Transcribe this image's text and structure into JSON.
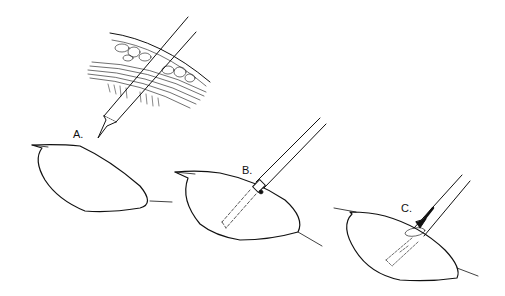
{
  "figure": {
    "type": "surgical-technique-illustration",
    "ink_color": "#111111",
    "background": "#ffffff",
    "inset": {
      "description": "cross-section of tissue layers (skin, fat, muscle fascia) with instrument passing through"
    },
    "panels": [
      {
        "id": "A",
        "label": "A.",
        "description": "instrument tip approaching lesion"
      },
      {
        "id": "B",
        "label": "B.",
        "description": "instrument inserted into lesion with dashed path inside"
      },
      {
        "id": "C",
        "label": "C.",
        "description": "instrument advanced with arrow; dashed implanted track inside lesion"
      }
    ]
  }
}
